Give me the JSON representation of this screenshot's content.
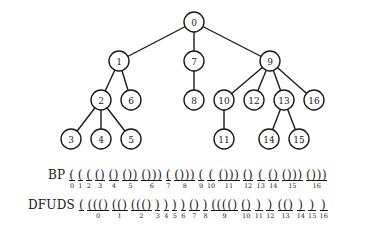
{
  "tree": {
    "nodes": [
      {
        "id": "0",
        "x": 194,
        "y": 22
      },
      {
        "id": "1",
        "x": 119,
        "y": 61
      },
      {
        "id": "7",
        "x": 194,
        "y": 61
      },
      {
        "id": "9",
        "x": 270,
        "y": 61
      },
      {
        "id": "2",
        "x": 101,
        "y": 100
      },
      {
        "id": "6",
        "x": 131,
        "y": 100
      },
      {
        "id": "8",
        "x": 194,
        "y": 100
      },
      {
        "id": "10",
        "x": 224,
        "y": 100
      },
      {
        "id": "12",
        "x": 254,
        "y": 100
      },
      {
        "id": "13",
        "x": 284,
        "y": 100
      },
      {
        "id": "16",
        "x": 314,
        "y": 100
      },
      {
        "id": "3",
        "x": 71,
        "y": 139
      },
      {
        "id": "4",
        "x": 101,
        "y": 139
      },
      {
        "id": "5",
        "x": 131,
        "y": 139
      },
      {
        "id": "11",
        "x": 224,
        "y": 139
      },
      {
        "id": "14",
        "x": 269,
        "y": 139
      },
      {
        "id": "15",
        "x": 299,
        "y": 139
      }
    ],
    "edges": [
      [
        "0",
        "1"
      ],
      [
        "0",
        "7"
      ],
      [
        "0",
        "9"
      ],
      [
        "1",
        "2"
      ],
      [
        "1",
        "6"
      ],
      [
        "2",
        "3"
      ],
      [
        "2",
        "4"
      ],
      [
        "2",
        "5"
      ],
      [
        "7",
        "8"
      ],
      [
        "9",
        "10"
      ],
      [
        "9",
        "12"
      ],
      [
        "9",
        "13"
      ],
      [
        "9",
        "16"
      ],
      [
        "10",
        "11"
      ],
      [
        "13",
        "14"
      ],
      [
        "13",
        "15"
      ]
    ],
    "radius": 10
  },
  "bp": {
    "label": "BP",
    "groups": [
      {
        "p": "(",
        "i": "0",
        "u": true
      },
      {
        "p": "(",
        "i": "1",
        "u": true
      },
      {
        "p": "(",
        "i": "2",
        "u": true
      },
      {
        "p": "()",
        "i": "3",
        "u": true
      },
      {
        "p": "()",
        "i": "4",
        "u": true
      },
      {
        "p": "())",
        "i": "5",
        "u": true
      },
      {
        "p": "()))",
        "i": "6",
        "u": true
      },
      {
        "p": "(",
        "i": "7",
        "u": true
      },
      {
        "p": "()))",
        "i": "8",
        "u": true
      },
      {
        "p": "(",
        "i": "9",
        "u": true
      },
      {
        "p": "(",
        "i": "10",
        "u": true
      },
      {
        "p": "()))",
        "i": "11",
        "u": true
      },
      {
        "p": "()",
        "i": "12",
        "u": true
      },
      {
        "p": "(",
        "i": "13",
        "u": true
      },
      {
        "p": "()",
        "i": "14",
        "u": true
      },
      {
        "p": "()))",
        "i": "15",
        "u": true
      },
      {
        "p": "()))",
        "i": "16",
        "u": true
      }
    ]
  },
  "dfuds": {
    "label": "DFUDS",
    "groups": [
      {
        "p": "(",
        "i": "",
        "u": true
      },
      {
        "p": "((()",
        "i": "0",
        "u": true
      },
      {
        "p": "(()",
        "i": "1",
        "u": true
      },
      {
        "p": "((()",
        "i": "2",
        "u": true
      },
      {
        "p": ")",
        "i": "3",
        "u": true
      },
      {
        "p": ")",
        "i": "4",
        "u": true
      },
      {
        "p": ")",
        "i": "5",
        "u": true
      },
      {
        "p": ")",
        "i": "6",
        "u": true
      },
      {
        "p": "()",
        "i": "7",
        "u": true
      },
      {
        "p": ")",
        "i": "8",
        "u": true
      },
      {
        "p": "(((()",
        "i": "9",
        "u": true
      },
      {
        "p": "()",
        "i": "10",
        "u": true
      },
      {
        "p": ")",
        "i": "11",
        "u": true
      },
      {
        "p": ")",
        "i": "12",
        "u": true
      },
      {
        "p": "(()",
        "i": "13",
        "u": true
      },
      {
        "p": ")",
        "i": "14",
        "u": true
      },
      {
        "p": ")",
        "i": "15",
        "u": true
      },
      {
        "p": ")",
        "i": "16",
        "u": true
      }
    ]
  }
}
